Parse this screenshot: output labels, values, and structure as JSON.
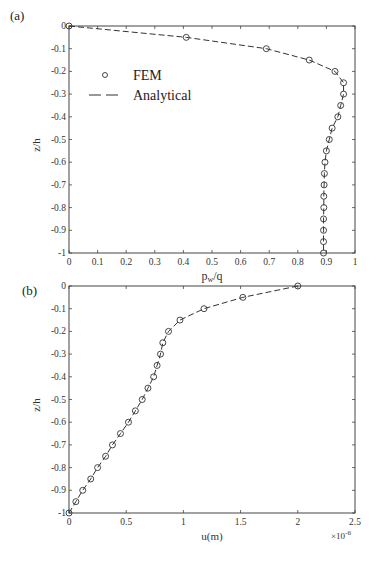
{
  "chart_data": [
    {
      "panel": "(a)",
      "type": "line",
      "title": "",
      "xlabel": "pw/q",
      "ylabel": "z/h",
      "xlim": [
        0,
        1
      ],
      "ylim": [
        -1,
        0
      ],
      "xticks": [
        "0",
        "0.1",
        "0.2",
        "0.3",
        "0.4",
        "0.5",
        "0.6",
        "0.7",
        "0.8",
        "0.9",
        "1"
      ],
      "yticks": [
        "0",
        "-0.1",
        "-0.2",
        "-0.3",
        "-0.4",
        "-0.5",
        "-0.6",
        "-0.7",
        "-0.8",
        "-0.9",
        "-1"
      ],
      "grid": false,
      "legend": {
        "position": "upper-left",
        "entries": [
          "FEM",
          "Analytical"
        ]
      },
      "series": [
        {
          "name": "FEM",
          "style": "open-circle-markers",
          "y": [
            0,
            -0.05,
            -0.1,
            -0.15,
            -0.2,
            -0.25,
            -0.3,
            -0.35,
            -0.4,
            -0.45,
            -0.5,
            -0.55,
            -0.6,
            -0.65,
            -0.7,
            -0.75,
            -0.8,
            -0.85,
            -0.9,
            -0.95,
            -1
          ],
          "x": [
            0,
            0.41,
            0.69,
            0.84,
            0.93,
            0.96,
            0.96,
            0.95,
            0.94,
            0.92,
            0.91,
            0.9,
            0.895,
            0.893,
            0.892,
            0.891,
            0.891,
            0.89,
            0.89,
            0.89,
            0.89
          ]
        },
        {
          "name": "Analytical",
          "style": "dashed-line",
          "y": [
            0,
            -0.05,
            -0.1,
            -0.15,
            -0.2,
            -0.25,
            -0.3,
            -0.35,
            -0.4,
            -0.45,
            -0.5,
            -0.55,
            -0.6,
            -0.65,
            -0.7,
            -0.75,
            -0.8,
            -0.85,
            -0.9,
            -0.95,
            -1
          ],
          "x": [
            0,
            0.41,
            0.69,
            0.84,
            0.93,
            0.96,
            0.96,
            0.95,
            0.94,
            0.92,
            0.91,
            0.9,
            0.895,
            0.893,
            0.892,
            0.891,
            0.891,
            0.89,
            0.89,
            0.89,
            0.89
          ]
        }
      ]
    },
    {
      "panel": "(b)",
      "type": "line",
      "title": "",
      "xlabel": "u(m)",
      "ylabel": "z/h",
      "x_multiplier": "×10^-6",
      "xlim": [
        0,
        2.5
      ],
      "ylim": [
        -1,
        0
      ],
      "xticks": [
        "0",
        "0.5",
        "1",
        "1.5",
        "2",
        "2.5"
      ],
      "yticks": [
        "0",
        "-0.1",
        "-0.2",
        "-0.3",
        "-0.4",
        "-0.5",
        "-0.6",
        "-0.7",
        "-0.8",
        "-0.9",
        "-1"
      ],
      "grid": false,
      "series": [
        {
          "name": "FEM",
          "style": "open-circle-markers",
          "y": [
            0,
            -0.05,
            -0.1,
            -0.15,
            -0.2,
            -0.25,
            -0.3,
            -0.35,
            -0.4,
            -0.45,
            -0.5,
            -0.55,
            -0.6,
            -0.65,
            -0.7,
            -0.75,
            -0.8,
            -0.85,
            -0.9,
            -0.95,
            -1
          ],
          "x": [
            2.0,
            1.52,
            1.18,
            0.97,
            0.87,
            0.82,
            0.8,
            0.77,
            0.74,
            0.69,
            0.64,
            0.58,
            0.52,
            0.45,
            0.38,
            0.32,
            0.25,
            0.19,
            0.12,
            0.06,
            0.0
          ]
        },
        {
          "name": "Analytical",
          "style": "dashed-line",
          "y": [
            0,
            -0.05,
            -0.1,
            -0.15,
            -0.2,
            -0.25,
            -0.3,
            -0.35,
            -0.4,
            -0.45,
            -0.5,
            -0.55,
            -0.6,
            -0.65,
            -0.7,
            -0.75,
            -0.8,
            -0.85,
            -0.9,
            -0.95,
            -1
          ],
          "x": [
            2.0,
            1.52,
            1.18,
            0.97,
            0.87,
            0.82,
            0.8,
            0.77,
            0.74,
            0.69,
            0.64,
            0.58,
            0.52,
            0.45,
            0.38,
            0.32,
            0.25,
            0.19,
            0.12,
            0.06,
            0.0
          ]
        }
      ]
    }
  ],
  "labels": {
    "panel_a": "(a)",
    "panel_b": "(b)",
    "a_xlabel_main": "p",
    "a_xlabel_sub": "w",
    "a_xlabel_tail": "/q",
    "a_ylabel": "z/h",
    "b_xlabel": "u(m)",
    "b_ylabel": "z/h",
    "b_exp_base": "×10",
    "b_exp_power": "-6",
    "legend_fem": "FEM",
    "legend_analytical": "Analytical"
  },
  "colors": {
    "axis": "#444444",
    "line": "#333333",
    "marker": "#333333"
  }
}
